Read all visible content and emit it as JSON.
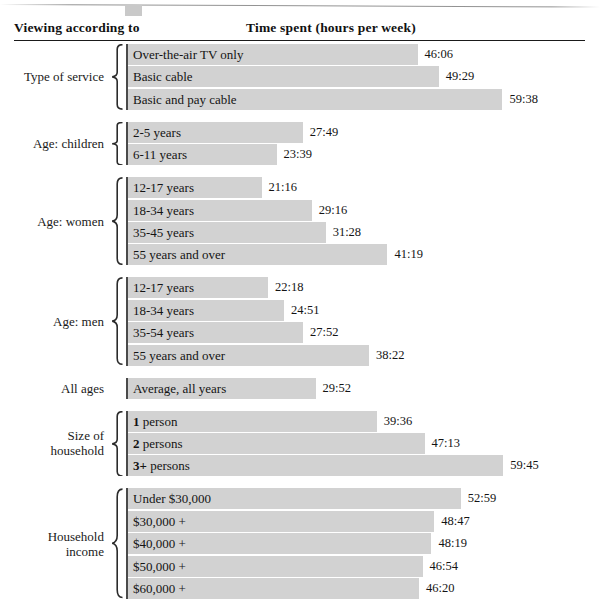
{
  "header": {
    "left_title": "Viewing according to",
    "right_title": "Time spent (hours per week)"
  },
  "chart_data": {
    "type": "bar",
    "orientation": "horizontal",
    "title": "Time spent (hours per week)",
    "xlabel": "Time spent (hours per week)",
    "ylabel": "Viewing according to",
    "grid": false,
    "legend": null,
    "axis_start_hours": 0,
    "px_per_hour": 6.28,
    "bar_origin_px": 128,
    "groups": [
      {
        "label": "Type of service",
        "label_lines": [
          "Type of service"
        ],
        "brace": true,
        "rows": [
          {
            "category": "Over-the-air TV only",
            "bold_prefix": "",
            "value": "46:06",
            "hours": 46.1
          },
          {
            "category": "Basic cable",
            "bold_prefix": "",
            "value": "49:29",
            "hours": 49.48
          },
          {
            "category": "Basic and pay cable",
            "bold_prefix": "",
            "value": "59:38",
            "hours": 59.63
          }
        ]
      },
      {
        "label": "Age: children",
        "label_lines": [
          "Age: children"
        ],
        "brace": true,
        "rows": [
          {
            "category": "2-5 years",
            "bold_prefix": "",
            "value": "27:49",
            "hours": 27.82
          },
          {
            "category": "6-11 years",
            "bold_prefix": "",
            "value": "23:39",
            "hours": 23.65
          }
        ]
      },
      {
        "label": "Age: women",
        "label_lines": [
          "Age: women"
        ],
        "brace": true,
        "rows": [
          {
            "category": "12-17 years",
            "bold_prefix": "",
            "value": "21:16",
            "hours": 21.27
          },
          {
            "category": "18-34 years",
            "bold_prefix": "",
            "value": "29:16",
            "hours": 29.27
          },
          {
            "category": "35-45 years",
            "bold_prefix": "",
            "value": "31:28",
            "hours": 31.47
          },
          {
            "category": "55 years and over",
            "bold_prefix": "",
            "value": "41:19",
            "hours": 41.32
          }
        ]
      },
      {
        "label": "Age: men",
        "label_lines": [
          "Age: men"
        ],
        "brace": true,
        "rows": [
          {
            "category": "12-17 years",
            "bold_prefix": "",
            "value": "22:18",
            "hours": 22.3
          },
          {
            "category": "18-34 years",
            "bold_prefix": "",
            "value": "24:51",
            "hours": 24.85
          },
          {
            "category": "35-54 years",
            "bold_prefix": "",
            "value": "27:52",
            "hours": 27.87
          },
          {
            "category": "55 years and over",
            "bold_prefix": "",
            "value": "38:22",
            "hours": 38.37
          }
        ]
      },
      {
        "label": "All ages",
        "label_lines": [
          "All ages"
        ],
        "brace": false,
        "rows": [
          {
            "category": "Average, all years",
            "bold_prefix": "",
            "value": "29:52",
            "hours": 29.87
          }
        ]
      },
      {
        "label": "Size of household",
        "label_lines": [
          "Size of",
          "household"
        ],
        "brace": true,
        "rows": [
          {
            "category": " person",
            "bold_prefix": "1",
            "value": "39:36",
            "hours": 39.6
          },
          {
            "category": " persons",
            "bold_prefix": "2",
            "value": "47:13",
            "hours": 47.22
          },
          {
            "category": " persons",
            "bold_prefix": "3+",
            "value": "59:45",
            "hours": 59.75
          }
        ]
      },
      {
        "label": "Household income",
        "label_lines": [
          "Household",
          "income"
        ],
        "brace": true,
        "rows": [
          {
            "category": "Under $30,000",
            "bold_prefix": "",
            "value": "52:59",
            "hours": 52.98
          },
          {
            "category": "$30,000 +",
            "bold_prefix": "",
            "value": "48:47",
            "hours": 48.78
          },
          {
            "category": "$40,000 +",
            "bold_prefix": "",
            "value": "48:19",
            "hours": 48.32
          },
          {
            "category": "$50,000 +",
            "bold_prefix": "",
            "value": "46:54",
            "hours": 46.9
          },
          {
            "category": "$60,000 +",
            "bold_prefix": "",
            "value": "46:20",
            "hours": 46.33
          }
        ]
      }
    ]
  },
  "colors": {
    "bar_fill": "#d2d2d2",
    "axis_line": "#4a4a4a",
    "header_rule": "#1a1a1a",
    "text": "#141414",
    "page_background": "#ffffff"
  }
}
